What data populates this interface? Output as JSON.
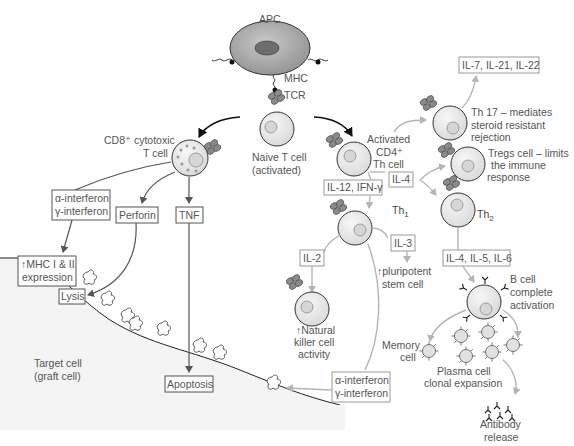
{
  "diagram": {
    "apc": {
      "label": "APC",
      "mhc": "MHC",
      "tcr": "TCR"
    },
    "naive_t_cell": {
      "line1": "Naive T cell",
      "line2": "(activated)"
    },
    "cd8_cell": {
      "line1": "CD8⁺ cytotoxic",
      "line2": "T cell"
    },
    "cd4_cell": {
      "line1": "Activated",
      "line2": "CD4⁺",
      "line3": "Th cell"
    },
    "cd8_products": {
      "interferon_box": {
        "line1": "α-interferon",
        "line2": "γ-interferon"
      },
      "perforin": "Perforin",
      "tnf": "TNF"
    },
    "target_effects": {
      "mhc_expression": {
        "line1": "↑MHC I & II",
        "line2": "expression"
      },
      "lysis": "Lysis",
      "apoptosis": "Apoptosis"
    },
    "target_cell": {
      "line1": "Target cell",
      "line2": "(graft cell)"
    },
    "th17": {
      "cytokines": "IL-7, IL-21, IL-22",
      "line1": "Th 17 – mediates",
      "line2": "steroid resistant",
      "line3": "rejection"
    },
    "tregs": {
      "line1": "Tregs cell – limits",
      "line2": "the immune",
      "line3": "response"
    },
    "il4_box": "IL-4",
    "il12_box": "IL-12, IFN-γ",
    "th1": {
      "label": "Th",
      "sub": "1"
    },
    "th2": {
      "label": "Th",
      "sub": "2"
    },
    "il2_box": "IL-2",
    "il3_box": "IL-3",
    "stem_cell": {
      "line1": "↑pluripotent",
      "line2": "stem cell"
    },
    "nk_cell": {
      "line1": "↑Natural",
      "line2": "killer cell",
      "line3": "activity"
    },
    "th1_interferon_box": {
      "line1": "α-interferon",
      "line2": "γ-interferon"
    },
    "il456_box": "IL-4, IL-5, IL-6",
    "b_cell": {
      "line1": "B cell",
      "line2": "complete",
      "line3": "activation"
    },
    "memory_cell": {
      "line1": "Memory",
      "line2": "cell"
    },
    "plasma_cell": {
      "line1": "Plasma cell",
      "line2": "clonal expansion"
    },
    "antibody": {
      "line1": "Antibody",
      "line2": "release"
    }
  },
  "colors": {
    "cell_fill": "#e9e9e9",
    "target_region": "#f4f4f4",
    "label_text": "#555555",
    "dark_arrow": "#555555",
    "light_arrow": "#b5b5b5"
  }
}
